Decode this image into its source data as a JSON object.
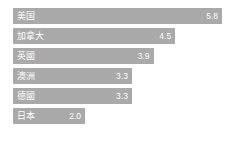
{
  "chart_data": {
    "type": "bar",
    "orientation": "horizontal",
    "title": "",
    "subtitle": "",
    "xlabel": "",
    "ylabel": "",
    "grid": false,
    "legend": null,
    "xlim": [
      0,
      5.8
    ],
    "categories": [
      "美国",
      "加拿大",
      "英國",
      "澳洲",
      "德國",
      "日本"
    ],
    "values": [
      5.8,
      4.5,
      3.9,
      3.3,
      3.3,
      2.0
    ],
    "value_labels": [
      "5.8",
      "4.5",
      "3.9",
      "3.3",
      "3.3",
      "2.0"
    ],
    "bars": [
      {
        "label": "美国",
        "value": 5.8,
        "value_label": "5.8"
      },
      {
        "label": "加拿大",
        "value": 4.5,
        "value_label": "4.5"
      },
      {
        "label": "英國",
        "value": 3.9,
        "value_label": "3.9"
      },
      {
        "label": "澳洲",
        "value": 3.3,
        "value_label": "3.3"
      },
      {
        "label": "德國",
        "value": 3.3,
        "value_label": "3.3"
      },
      {
        "label": "日本",
        "value": 2.0,
        "value_label": "2.0"
      }
    ],
    "colors": {
      "bar": "#a9a9a9",
      "background": "#ffffff",
      "label_text": "#ffffff",
      "value_text": "#ffffff"
    }
  }
}
